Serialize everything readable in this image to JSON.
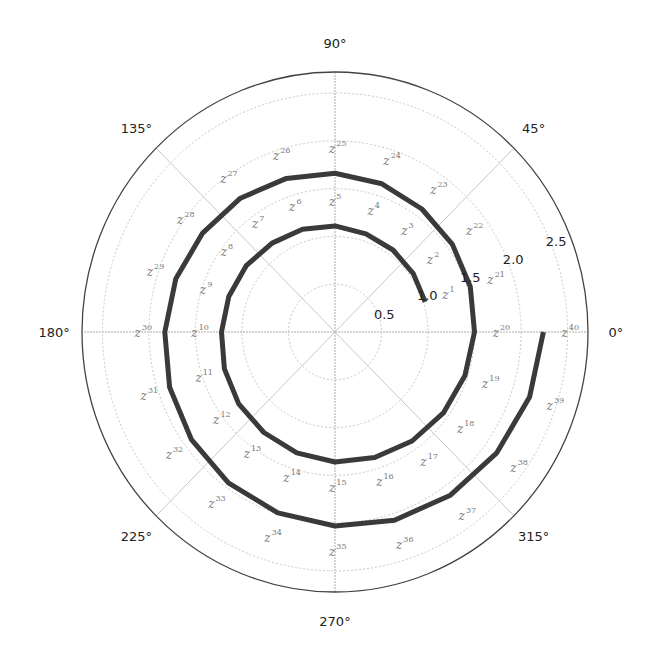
{
  "chart_data": {
    "type": "line",
    "projection": "polar",
    "title": "",
    "series": [
      {
        "name": "z^n",
        "color": "#3a3a3a",
        "n_start": 1,
        "n_end": 40,
        "modulus": 1.0205,
        "angle_step_deg": 18,
        "points": [
          {
            "n": 1,
            "theta_deg": 18,
            "r": 1.02
          },
          {
            "n": 2,
            "theta_deg": 36,
            "r": 1.04
          },
          {
            "n": 3,
            "theta_deg": 54,
            "r": 1.06
          },
          {
            "n": 4,
            "theta_deg": 72,
            "r": 1.08
          },
          {
            "n": 5,
            "theta_deg": 90,
            "r": 1.11
          },
          {
            "n": 6,
            "theta_deg": 108,
            "r": 1.13
          },
          {
            "n": 7,
            "theta_deg": 126,
            "r": 1.15
          },
          {
            "n": 8,
            "theta_deg": 144,
            "r": 1.18
          },
          {
            "n": 9,
            "theta_deg": 162,
            "r": 1.2
          },
          {
            "n": 10,
            "theta_deg": 180,
            "r": 1.22
          },
          {
            "n": 11,
            "theta_deg": 198,
            "r": 1.25
          },
          {
            "n": 12,
            "theta_deg": 216,
            "r": 1.28
          },
          {
            "n": 13,
            "theta_deg": 234,
            "r": 1.3
          },
          {
            "n": 14,
            "theta_deg": 252,
            "r": 1.33
          },
          {
            "n": 15,
            "theta_deg": 270,
            "r": 1.36
          },
          {
            "n": 16,
            "theta_deg": 288,
            "r": 1.38
          },
          {
            "n": 17,
            "theta_deg": 306,
            "r": 1.41
          },
          {
            "n": 18,
            "theta_deg": 324,
            "r": 1.44
          },
          {
            "n": 19,
            "theta_deg": 342,
            "r": 1.47
          },
          {
            "n": 20,
            "theta_deg": 360,
            "r": 1.5
          },
          {
            "n": 21,
            "theta_deg": 378,
            "r": 1.53
          },
          {
            "n": 22,
            "theta_deg": 396,
            "r": 1.56
          },
          {
            "n": 23,
            "theta_deg": 414,
            "r": 1.59
          },
          {
            "n": 24,
            "theta_deg": 432,
            "r": 1.63
          },
          {
            "n": 25,
            "theta_deg": 450,
            "r": 1.66
          },
          {
            "n": 26,
            "theta_deg": 468,
            "r": 1.69
          },
          {
            "n": 27,
            "theta_deg": 486,
            "r": 1.73
          },
          {
            "n": 28,
            "theta_deg": 504,
            "r": 1.76
          },
          {
            "n": 29,
            "theta_deg": 522,
            "r": 1.8
          },
          {
            "n": 30,
            "theta_deg": 540,
            "r": 1.83
          },
          {
            "n": 31,
            "theta_deg": 558,
            "r": 1.87
          },
          {
            "n": 32,
            "theta_deg": 576,
            "r": 1.91
          },
          {
            "n": 33,
            "theta_deg": 594,
            "r": 1.95
          },
          {
            "n": 34,
            "theta_deg": 612,
            "r": 1.99
          },
          {
            "n": 35,
            "theta_deg": 630,
            "r": 2.03
          },
          {
            "n": 36,
            "theta_deg": 648,
            "r": 2.07
          },
          {
            "n": 37,
            "theta_deg": 666,
            "r": 2.11
          },
          {
            "n": 38,
            "theta_deg": 684,
            "r": 2.15
          },
          {
            "n": 39,
            "theta_deg": 702,
            "r": 2.2
          },
          {
            "n": 40,
            "theta_deg": 720,
            "r": 2.24
          }
        ]
      }
    ],
    "point_labels": "z^n for n = 1..40 (label '1.0' overlaps z^1 near start)",
    "angular_ticks": [
      "0°",
      "45°",
      "90°",
      "135°",
      "180°",
      "225°",
      "270°",
      "315°"
    ],
    "radial_ticks": [
      "0.5",
      "1.0",
      "1.5",
      "2.0",
      "2.5"
    ],
    "radial_tick_values": [
      0.5,
      1.0,
      1.5,
      2.0,
      2.5
    ],
    "rlim": [
      0,
      2.72
    ],
    "radial_label_angle_deg": 22.5,
    "grid": true,
    "legend": null
  },
  "colors": {
    "line": "#3a3a3a",
    "grid": "#c8c8c8",
    "axis_line": "#444444",
    "point_label": "#808080",
    "tick_label": "#222222"
  }
}
